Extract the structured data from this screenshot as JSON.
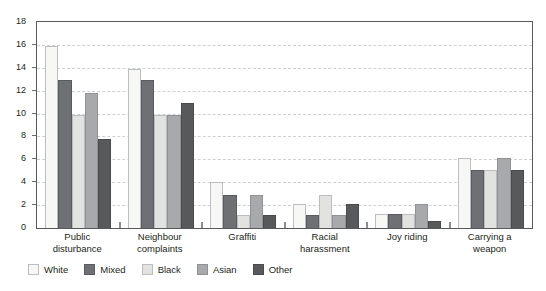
{
  "chart_data": {
    "type": "bar",
    "title": "",
    "subtitle": "",
    "xlabel": "",
    "ylabel": "",
    "ylim": [
      0,
      18
    ],
    "yticks": [
      0,
      2,
      4,
      6,
      8,
      10,
      12,
      14,
      16,
      18
    ],
    "grid": "horizontal-dashed",
    "legend_position": "bottom-left",
    "categories": [
      "Public disturbance",
      "Neighbour complaints",
      "Graffiti",
      "Racial harassment",
      "Joy riding",
      "Carrying a weapon"
    ],
    "category_lines": [
      [
        "Public",
        "disturbance"
      ],
      [
        "Neighbour",
        "complaints"
      ],
      [
        "Graffiti"
      ],
      [
        "Racial",
        "harassment"
      ],
      [
        "Joy riding"
      ],
      [
        "Carrying a",
        "weapon"
      ]
    ],
    "series": [
      {
        "name": "White",
        "color": "#f7f7f5",
        "values": [
          15.9,
          13.9,
          4.0,
          2.1,
          1.2,
          6.1
        ]
      },
      {
        "name": "Mixed",
        "color": "#6f7073",
        "values": [
          12.9,
          12.9,
          2.9,
          1.1,
          1.2,
          5.1
        ]
      },
      {
        "name": "Black",
        "color": "#e2e3e1",
        "values": [
          9.9,
          9.9,
          1.1,
          2.9,
          1.2,
          5.1
        ]
      },
      {
        "name": "Asian",
        "color": "#a7a9ab",
        "values": [
          11.8,
          9.9,
          2.9,
          1.1,
          2.1,
          6.1
        ]
      },
      {
        "name": "Other",
        "color": "#58595b",
        "values": [
          7.8,
          10.9,
          1.1,
          2.1,
          0.6,
          5.1
        ]
      }
    ]
  },
  "legend": {
    "items": [
      {
        "label": "White",
        "swatch": "sw-white"
      },
      {
        "label": "Mixed",
        "swatch": "sw-mixed"
      },
      {
        "label": "Black",
        "swatch": "sw-black"
      },
      {
        "label": "Asian",
        "swatch": "sw-asian"
      },
      {
        "label": "Other",
        "swatch": "sw-other"
      }
    ]
  }
}
